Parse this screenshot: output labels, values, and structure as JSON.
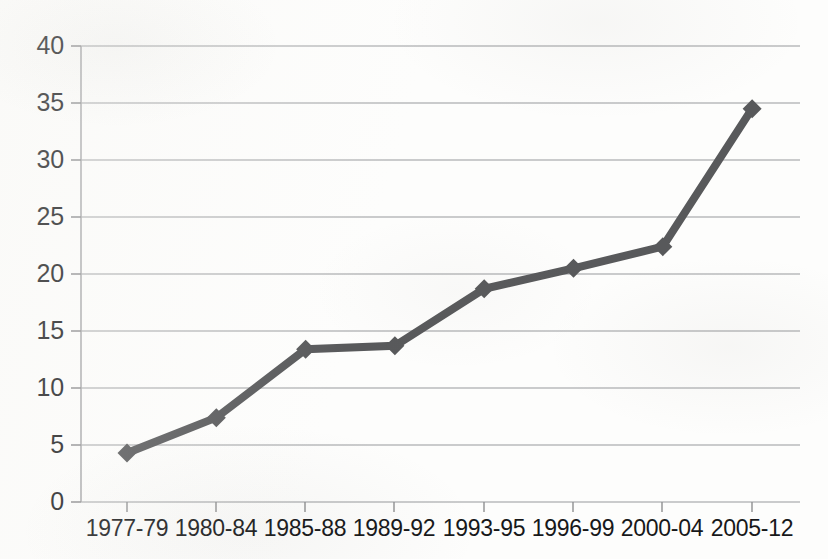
{
  "chart_data": {
    "type": "line",
    "title": "",
    "subtitle": "",
    "xlabel": "",
    "ylabel": "",
    "categories": [
      "1977-79",
      "1980-84",
      "1985-88",
      "1989-92",
      "1993-95",
      "1996-99",
      "2000-04",
      "2005-12"
    ],
    "series": [
      {
        "name": "",
        "values": [
          4.3,
          7.4,
          13.4,
          13.7,
          18.7,
          20.5,
          22.4,
          34.5
        ]
      }
    ],
    "ylim": [
      0,
      40
    ],
    "yticks": [
      0,
      5,
      10,
      15,
      20,
      25,
      30,
      35,
      40
    ],
    "ytick_labels": [
      "0",
      "5",
      "10",
      "15",
      "20",
      "25",
      "30",
      "35",
      "40"
    ],
    "grid": "horizontal",
    "legend": "none",
    "marker": "diamond",
    "line_color": "#58595b",
    "marker_color": "#58595b",
    "grid_color": "#b9babc",
    "axis_color": "#9b9c9e",
    "background_color": "#ffffff",
    "annotations": []
  }
}
